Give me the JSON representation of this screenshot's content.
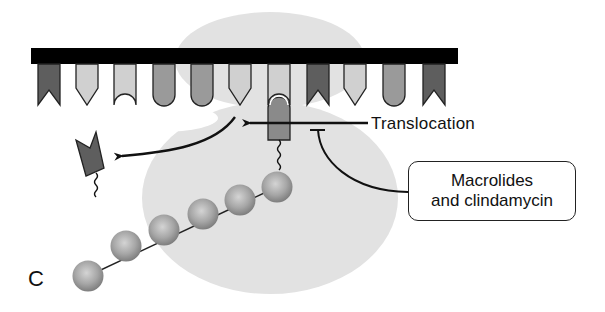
{
  "figure": {
    "panel_letter": "C",
    "labels": {
      "translocation": "Translocation",
      "drug_line1": "Macrolides",
      "drug_line2": "and clindamycin"
    },
    "colors": {
      "ribosome": "#e2e2e2",
      "mrna": "#000000",
      "dark_codon": "#5e5e5e",
      "mid_codon": "#9a9a9a",
      "light_codon": "#d0d0d0",
      "bead": "#a9a9a9",
      "line": "#111111"
    },
    "mrna_codons": [
      {
        "x": 38,
        "shape": "notch",
        "shade": "dark"
      },
      {
        "x": 76,
        "shape": "point",
        "shade": "light"
      },
      {
        "x": 114,
        "shape": "cup",
        "shade": "light"
      },
      {
        "x": 153,
        "shape": "round",
        "shade": "mid"
      },
      {
        "x": 191,
        "shape": "round",
        "shade": "mid"
      },
      {
        "x": 229,
        "shape": "point",
        "shade": "light"
      },
      {
        "x": 268,
        "shape": "cup",
        "shade": "light"
      },
      {
        "x": 307,
        "shape": "notch",
        "shade": "dark"
      },
      {
        "x": 344,
        "shape": "point",
        "shade": "light"
      },
      {
        "x": 383,
        "shape": "round",
        "shade": "mid"
      },
      {
        "x": 423,
        "shape": "notch",
        "shade": "dark"
      }
    ],
    "peptide_beads": [
      {
        "cx": 277,
        "cy": 187
      },
      {
        "cx": 240,
        "cy": 201
      },
      {
        "cx": 203,
        "cy": 214
      },
      {
        "cx": 164,
        "cy": 231
      },
      {
        "cx": 126,
        "cy": 247
      },
      {
        "cx": 88,
        "cy": 276
      }
    ]
  }
}
